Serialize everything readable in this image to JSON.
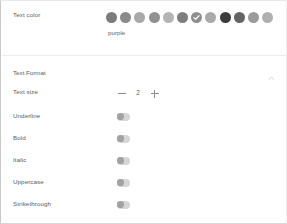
{
  "panel": {
    "color_section": {
      "label": "Text color",
      "selected_color_name": "purple",
      "selected_index": 6,
      "swatches": [
        {
          "name": "swatch-red",
          "hex": "#7c7c7c"
        },
        {
          "name": "swatch-orange",
          "hex": "#8a8a8a"
        },
        {
          "name": "swatch-yellow",
          "hex": "#a9a9a9"
        },
        {
          "name": "swatch-olive",
          "hex": "#919191"
        },
        {
          "name": "swatch-light-green",
          "hex": "#b4b4b4"
        },
        {
          "name": "swatch-green",
          "hex": "#7e7e7e"
        },
        {
          "name": "swatch-purple",
          "hex": "#8f8f8f"
        },
        {
          "name": "swatch-light-gray",
          "hex": "#aaaaaa"
        },
        {
          "name": "swatch-black",
          "hex": "#3c3c3c"
        },
        {
          "name": "swatch-dark-gray",
          "hex": "#636363"
        },
        {
          "name": "swatch-gray",
          "hex": "#9b9b9b"
        },
        {
          "name": "swatch-pale-gray",
          "hex": "#b0b0b0"
        }
      ]
    },
    "format_section": {
      "title": "Text Format",
      "chevron": "chevron-up-icon",
      "text_size": {
        "label": "Text size",
        "decrement_label": "−",
        "value": "2",
        "increment_label": "+"
      },
      "toggles": [
        {
          "label": "Underline",
          "state": "off"
        },
        {
          "label": "Bold",
          "state": "off"
        },
        {
          "label": "Italic",
          "state": "off"
        },
        {
          "label": "Uppercase",
          "state": "off"
        },
        {
          "label": "Strikethrough",
          "state": "off"
        }
      ]
    }
  }
}
